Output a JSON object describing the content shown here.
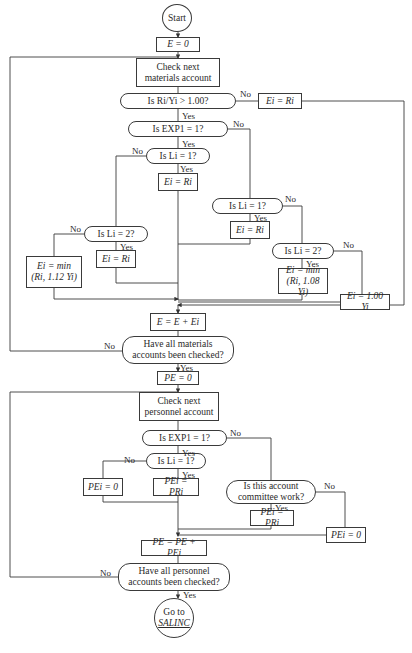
{
  "flowchart": {
    "start": "Start",
    "e_init": "E = 0",
    "check_materials": "Check next materials account",
    "q_ratio": "Is Ri/Yi > 1.00?",
    "ratio_no_box": "Ei = Ri",
    "q_exp1_mat": "Is EXP1 = 1?",
    "q_l1_left": "Is Li = 1?",
    "l1_left_yes_box": "Ei = Ri",
    "q_l2_left": "Is Li = 2?",
    "l2_left_yes_box": "Ei = Ri",
    "l2_left_no_box": "Ei = min (Ri, 1.12 Yi)",
    "q_l1_right": "Is Li = 1?",
    "l1_right_yes_box": "Ei = Ri",
    "q_l2_right": "Is Li = 2?",
    "l2_right_yes_box": "Ei = min (Ri, 1.08 Yi)",
    "l2_right_no_box": "Ei = 1.00 Yi",
    "e_accum": "E = E + Ei",
    "q_all_materials": "Have all materials accounts been checked?",
    "pe_init": "PE = 0",
    "check_personnel": "Check next personnel account",
    "q_exp1_pers": "Is EXP1 = 1?",
    "q_l1_pers": "Is Li = 1?",
    "pers_l1_no_box": "PEi = 0",
    "pers_l1_yes_box": "PEi = PRi",
    "q_committee": "Is this account committee work?",
    "committee_yes_box": "PEi = PRi",
    "committee_no_box": "PEi = 0",
    "pe_accum": "PE = PE + PEi",
    "q_all_personnel": "Have all personnel accounts been checked?",
    "goto_line1": "Go to",
    "goto_target": "SALINC"
  },
  "labels": {
    "yes": "Yes",
    "no": "No"
  }
}
